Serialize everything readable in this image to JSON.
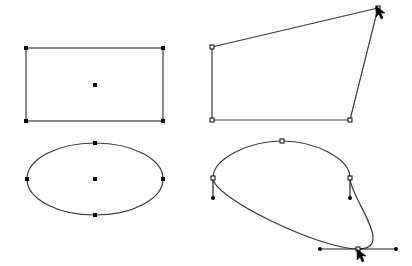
{
  "canvas": {
    "width": 412,
    "height": 266,
    "background": "#ffffff",
    "stroke": "#3a3a3a",
    "handle_color": "#000000"
  },
  "shapes": {
    "rectangle": {
      "x": 26,
      "y": 48,
      "width": 137,
      "height": 73,
      "corners": [
        [
          26,
          48
        ],
        [
          163,
          48
        ],
        [
          26,
          121
        ],
        [
          163,
          121
        ]
      ],
      "center": [
        95,
        85
      ],
      "handle_style": "filled"
    },
    "quadrilateral": {
      "points": [
        [
          212,
          47
        ],
        [
          378,
          8
        ],
        [
          350,
          120
        ],
        [
          212,
          120
        ]
      ],
      "handle_style": "hollow"
    },
    "ellipse": {
      "cx": 95,
      "cy": 179,
      "rx": 68,
      "ry": 36,
      "handles": [
        [
          95,
          143
        ],
        [
          163,
          179
        ],
        [
          95,
          215
        ],
        [
          27,
          179
        ]
      ],
      "center": [
        95,
        179
      ],
      "handle_style": "filled"
    },
    "bezier": {
      "path": "M213,178 C213,158 250,141 282,141 C314,141 350,158 350,178 C350,198 396,249 358,249 C320,249 213,198 213,178 Z",
      "anchors": [
        [
          213,
          178
        ],
        [
          282,
          141
        ],
        [
          350,
          178
        ],
        [
          358,
          249
        ]
      ],
      "control_handles": [
        {
          "from": [
            213,
            178
          ],
          "to": [
            213,
            198
          ]
        },
        {
          "from": [
            350,
            178
          ],
          "to": [
            350,
            198
          ]
        },
        {
          "from": [
            358,
            249
          ],
          "to": [
            320,
            249
          ]
        },
        {
          "from": [
            358,
            249
          ],
          "to": [
            396,
            249
          ]
        }
      ],
      "handle_style": "hollow"
    }
  },
  "cursors": [
    {
      "name": "arrow-cursor-quad",
      "x": 376,
      "y": 6
    },
    {
      "name": "arrow-cursor-bezier",
      "x": 357,
      "y": 249
    }
  ]
}
